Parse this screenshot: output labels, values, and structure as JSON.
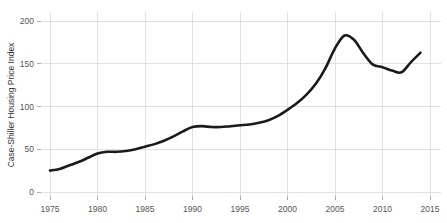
{
  "chart_data": {
    "type": "line",
    "title": "",
    "subtitle": "",
    "xlabel": "",
    "ylabel": "Case-Shiller Housing Price Index",
    "xlim": [
      1973,
      2016
    ],
    "ylim": [
      0,
      210
    ],
    "xticks": [
      1975,
      1980,
      1985,
      1990,
      1995,
      2000,
      2005,
      2010,
      2015
    ],
    "xticklabels": [
      "1975",
      "1980",
      "1985",
      "1990",
      "1995",
      "2000",
      "2005",
      "2010",
      "2015"
    ],
    "yticks": [
      0,
      50,
      100,
      150,
      200
    ],
    "yticklabels": [
      "0",
      "50",
      "100",
      "150",
      "200"
    ],
    "grid": true,
    "legend": false,
    "legend_position": "none",
    "line_color": "#1a1a1a",
    "grid_color": "#d9d9d9",
    "background_color": "#ffffff",
    "series": [
      {
        "name": "Case-Shiller Housing Price Index",
        "x": [
          1975,
          1976,
          1977,
          1978,
          1979,
          1980,
          1981,
          1982,
          1983,
          1984,
          1985,
          1986,
          1987,
          1988,
          1989,
          1990,
          1991,
          1992,
          1993,
          1994,
          1995,
          1996,
          1997,
          1998,
          1999,
          2000,
          2001,
          2002,
          2003,
          2004,
          2005,
          2006,
          2007,
          2008,
          2009,
          2010,
          2011,
          2012,
          2013,
          2014
        ],
        "values": [
          25,
          27,
          31,
          35,
          40,
          45,
          47,
          47,
          48,
          50,
          53,
          56,
          60,
          65,
          71,
          76,
          77,
          76,
          76,
          77,
          78,
          79,
          81,
          84,
          89,
          96,
          104,
          114,
          127,
          145,
          168,
          183,
          178,
          162,
          149,
          146,
          142,
          140,
          152,
          163
        ]
      }
    ],
    "annotations": []
  }
}
